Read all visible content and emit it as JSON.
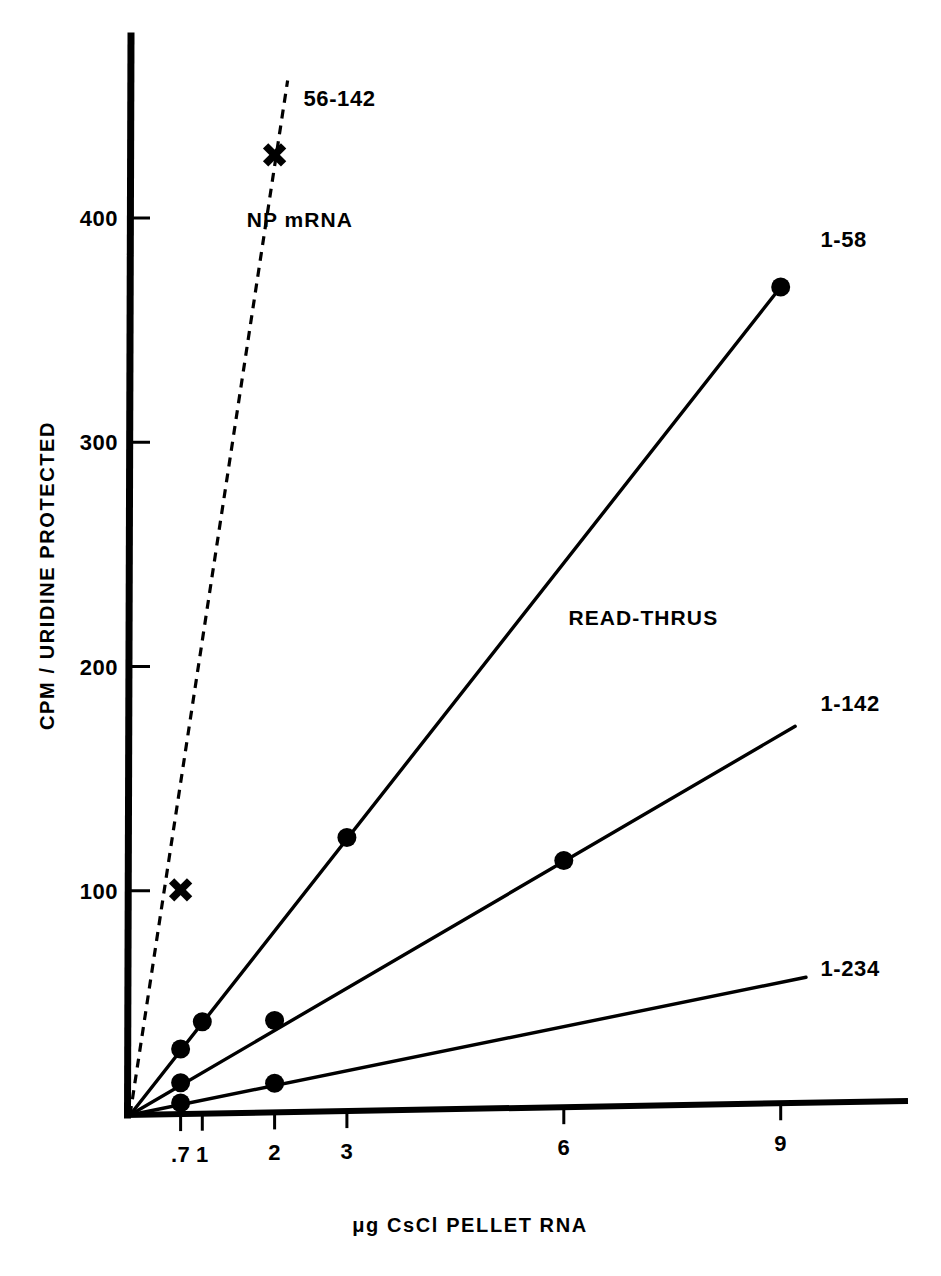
{
  "chart_data": {
    "type": "line",
    "title": "",
    "xlabel": "μg  CsCl  PELLET  RNA",
    "ylabel": "CPM / URIDINE  PROTECTED",
    "xlim": [
      0,
      9.8
    ],
    "ylim": [
      0,
      470
    ],
    "grid": false,
    "legend_position": "inline-end-labels",
    "x_ticks": [
      {
        "value": 0.7,
        "label": ".7"
      },
      {
        "value": 1,
        "label": "1"
      },
      {
        "value": 2,
        "label": "2"
      },
      {
        "value": 3,
        "label": "3"
      },
      {
        "value": 6,
        "label": "6"
      },
      {
        "value": 9,
        "label": "9"
      }
    ],
    "y_ticks": [
      {
        "value": 100,
        "label": "100"
      },
      {
        "value": 200,
        "label": "200"
      },
      {
        "value": 300,
        "label": "300"
      },
      {
        "value": 400,
        "label": "400"
      }
    ],
    "annotations": [
      {
        "text": "NP mRNA",
        "x": 2.35,
        "y": 398
      },
      {
        "text": "READ-THRUS",
        "x": 7.1,
        "y": 218
      }
    ],
    "series": [
      {
        "name": "56-142",
        "label": "56-142",
        "style": "dashed",
        "marker": "cross",
        "label_x": 2.4,
        "label_y": 452,
        "line": [
          [
            0,
            0
          ],
          [
            2.18,
            460
          ]
        ],
        "points": [
          [
            0.7,
            100
          ],
          [
            2.0,
            427
          ]
        ]
      },
      {
        "name": "1-58",
        "label": "1-58",
        "style": "solid",
        "marker": "dot",
        "label_x": 9.55,
        "label_y": 385,
        "line": [
          [
            0,
            0
          ],
          [
            9.0,
            364
          ]
        ],
        "points": [
          [
            0.7,
            29
          ],
          [
            1.0,
            41
          ],
          [
            3.0,
            122
          ],
          [
            9.0,
            364
          ]
        ]
      },
      {
        "name": "1-142",
        "label": "1-142",
        "style": "solid",
        "marker": "dot",
        "label_x": 9.55,
        "label_y": 178,
        "line": [
          [
            0,
            0
          ],
          [
            9.2,
            168
          ]
        ],
        "points": [
          [
            0.7,
            14
          ],
          [
            2.0,
            41
          ],
          [
            6.0,
            110
          ]
        ]
      },
      {
        "name": "1-234",
        "label": "1-234",
        "style": "solid",
        "marker": "dot",
        "label_x": 9.55,
        "label_y": 60,
        "line": [
          [
            0,
            0
          ],
          [
            9.35,
            56
          ]
        ],
        "points": [
          [
            0.7,
            5
          ],
          [
            2.0,
            13
          ]
        ]
      }
    ]
  },
  "axes": {
    "x_axis_name": "x-axis",
    "y_axis_name": "y-axis"
  },
  "colors": {
    "ink": "#000000",
    "paper": "#ffffff"
  }
}
